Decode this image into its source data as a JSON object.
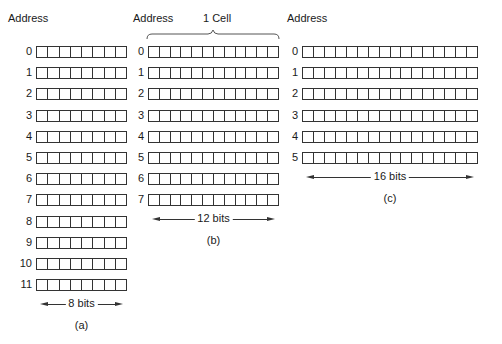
{
  "panels": [
    {
      "id": "a",
      "header": "Address",
      "caption": "(a)",
      "bits_label": "8 bits",
      "bits": 8,
      "addresses": [
        "0",
        "1",
        "2",
        "3",
        "4",
        "5",
        "6",
        "7",
        "8",
        "9",
        "10",
        "11"
      ]
    },
    {
      "id": "b",
      "header": "Address",
      "cell_label": "1 Cell",
      "caption": "(b)",
      "bits_label": "12 bits",
      "bits": 12,
      "addresses": [
        "0",
        "1",
        "2",
        "3",
        "4",
        "5",
        "6",
        "7"
      ]
    },
    {
      "id": "c",
      "header": "Address",
      "caption": "(c)",
      "bits_label": "16 bits",
      "bits": 16,
      "addresses": [
        "0",
        "1",
        "2",
        "3",
        "4",
        "5"
      ]
    }
  ]
}
